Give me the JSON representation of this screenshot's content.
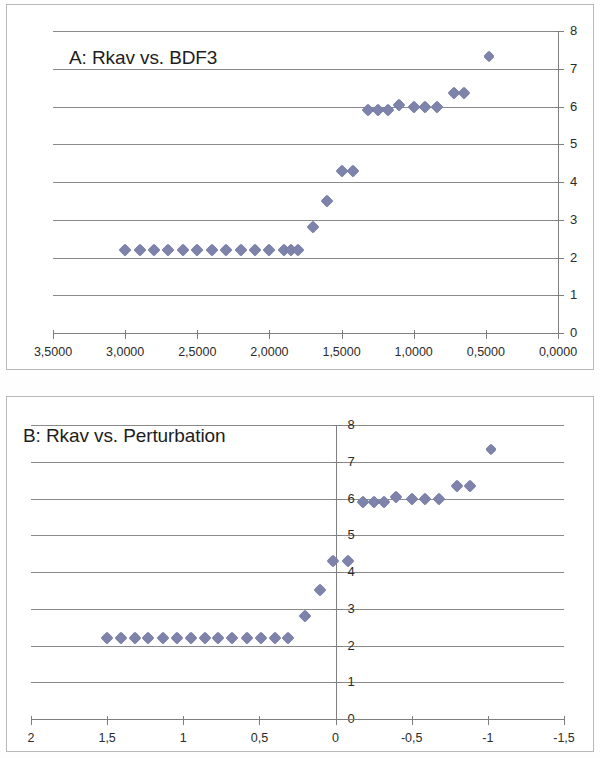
{
  "figure": {
    "panels": [
      "A",
      "B"
    ],
    "marker_color": "#7d83aa",
    "gridline_color": "#8a8a8a",
    "axis_color": "#7e7e7e"
  },
  "chart_data": [
    {
      "type": "scatter",
      "panel": "A",
      "title": "A: Rkav vs. BDF3",
      "xlabel": "",
      "ylabel": "",
      "xlim": [
        3.5,
        0.0
      ],
      "ylim": [
        0,
        8
      ],
      "x_reversed": true,
      "grid": true,
      "legend": null,
      "y_axis_position": "right",
      "x_ticks": [
        "3,5000",
        "3,0000",
        "2,5000",
        "2,0000",
        "1,5000",
        "1,0000",
        "0,5000",
        "0,0000"
      ],
      "x_tick_values": [
        3.5,
        3.0,
        2.5,
        2.0,
        1.5,
        1.0,
        0.5,
        0.0
      ],
      "y_ticks": [
        "0",
        "1",
        "2",
        "3",
        "4",
        "5",
        "6",
        "7",
        "8"
      ],
      "y_tick_values": [
        0,
        1,
        2,
        3,
        4,
        5,
        6,
        7,
        8
      ],
      "points": [
        {
          "x": 3.0,
          "y": 2.2
        },
        {
          "x": 2.9,
          "y": 2.2
        },
        {
          "x": 2.8,
          "y": 2.2
        },
        {
          "x": 2.7,
          "y": 2.2
        },
        {
          "x": 2.6,
          "y": 2.2
        },
        {
          "x": 2.5,
          "y": 2.2
        },
        {
          "x": 2.4,
          "y": 2.2
        },
        {
          "x": 2.3,
          "y": 2.2
        },
        {
          "x": 2.2,
          "y": 2.2
        },
        {
          "x": 2.1,
          "y": 2.2
        },
        {
          "x": 2.0,
          "y": 2.2
        },
        {
          "x": 1.9,
          "y": 2.2
        },
        {
          "x": 1.85,
          "y": 2.2
        },
        {
          "x": 1.8,
          "y": 2.2
        },
        {
          "x": 1.7,
          "y": 2.8
        },
        {
          "x": 1.6,
          "y": 3.5
        },
        {
          "x": 1.5,
          "y": 4.3
        },
        {
          "x": 1.42,
          "y": 4.3
        },
        {
          "x": 1.32,
          "y": 5.9
        },
        {
          "x": 1.25,
          "y": 5.9
        },
        {
          "x": 1.18,
          "y": 5.9
        },
        {
          "x": 1.1,
          "y": 6.05
        },
        {
          "x": 1.0,
          "y": 6.0
        },
        {
          "x": 0.92,
          "y": 6.0
        },
        {
          "x": 0.84,
          "y": 6.0
        },
        {
          "x": 0.72,
          "y": 6.35
        },
        {
          "x": 0.65,
          "y": 6.35
        },
        {
          "x": 0.48,
          "y": 7.35
        }
      ]
    },
    {
      "type": "scatter",
      "panel": "B",
      "title": "B: Rkav vs. Perturbation",
      "xlabel": "",
      "ylabel": "",
      "xlim": [
        2.0,
        -1.5
      ],
      "ylim": [
        0,
        8
      ],
      "x_reversed": true,
      "grid": true,
      "legend": null,
      "y_axis_position": "zero",
      "x_ticks": [
        "2",
        "1,5",
        "1",
        "0,5",
        "0",
        "-0,5",
        "-1",
        "-1,5"
      ],
      "x_tick_values": [
        2,
        1.5,
        1,
        0.5,
        0,
        -0.5,
        -1,
        -1.5
      ],
      "y_ticks": [
        "0",
        "1",
        "2",
        "3",
        "4",
        "5",
        "6",
        "7",
        "8"
      ],
      "y_tick_values": [
        0,
        1,
        2,
        3,
        4,
        5,
        6,
        7,
        8
      ],
      "points": [
        {
          "x": 1.5,
          "y": 2.2
        },
        {
          "x": 1.41,
          "y": 2.2
        },
        {
          "x": 1.32,
          "y": 2.2
        },
        {
          "x": 1.23,
          "y": 2.2
        },
        {
          "x": 1.13,
          "y": 2.2
        },
        {
          "x": 1.04,
          "y": 2.2
        },
        {
          "x": 0.95,
          "y": 2.2
        },
        {
          "x": 0.86,
          "y": 2.2
        },
        {
          "x": 0.77,
          "y": 2.2
        },
        {
          "x": 0.68,
          "y": 2.2
        },
        {
          "x": 0.58,
          "y": 2.2
        },
        {
          "x": 0.49,
          "y": 2.2
        },
        {
          "x": 0.4,
          "y": 2.2
        },
        {
          "x": 0.31,
          "y": 2.2
        },
        {
          "x": 0.2,
          "y": 2.8
        },
        {
          "x": 0.1,
          "y": 3.5
        },
        {
          "x": 0.02,
          "y": 4.3
        },
        {
          "x": -0.08,
          "y": 4.3
        },
        {
          "x": -0.18,
          "y": 5.9
        },
        {
          "x": -0.25,
          "y": 5.9
        },
        {
          "x": -0.32,
          "y": 5.9
        },
        {
          "x": -0.4,
          "y": 6.05
        },
        {
          "x": -0.5,
          "y": 6.0
        },
        {
          "x": -0.59,
          "y": 6.0
        },
        {
          "x": -0.68,
          "y": 6.0
        },
        {
          "x": -0.8,
          "y": 6.35
        },
        {
          "x": -0.88,
          "y": 6.35
        },
        {
          "x": -1.02,
          "y": 7.35
        }
      ]
    }
  ]
}
